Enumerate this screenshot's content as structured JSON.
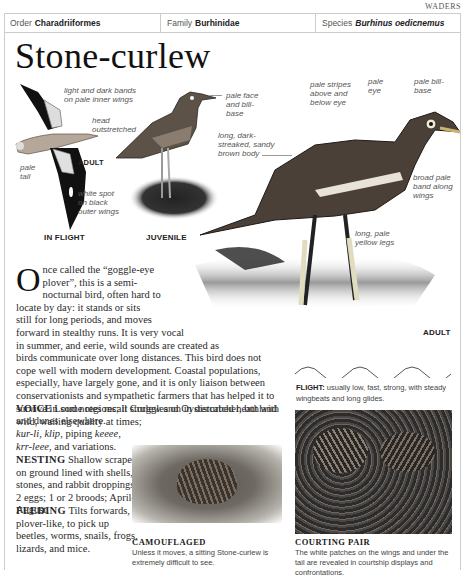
{
  "section_tag": "WADERS",
  "taxonomy": {
    "order_label": "Order",
    "order_value": "Charadriiformes",
    "family_label": "Family",
    "family_value": "Burhinidae",
    "species_label": "Species",
    "species_value": "Burhinus oedicnemus"
  },
  "title": "Stone-curlew",
  "illustrations": {
    "in_flight": {
      "caption": "IN FLIGHT",
      "sub_caption": "ADULT",
      "labels": {
        "bands": "light and dark bands on pale inner wings",
        "head": "head outstretched",
        "tail": "pale tail",
        "spot": "white spot on black outer wings"
      }
    },
    "juvenile": {
      "caption": "JUVENILE",
      "labels": {
        "face": "pale face and bill-base"
      }
    },
    "adult": {
      "caption": "ADULT",
      "labels": {
        "stripes": "pale stripes above and below eye",
        "eye": "pale eye",
        "bill": "pale bill-base",
        "body": "long, dark-streaked, sandy brown body",
        "band": "broad pale band along wings",
        "legs": "long, pale yellow legs"
      }
    }
  },
  "body": {
    "dropcap": "O",
    "intro_line1": "nce called the “goggle-eye",
    "intro_line2": "plover”, this is a semi-",
    "intro_line3": "nocturnal bird, often hard to",
    "intro_line4": "locate by day: it stands or sits",
    "intro_line5": "still for long periods, and moves",
    "intro_line6": "forward in stealthy runs. It is very vocal",
    "intro_line7": "in summer, and eerie, wild sounds are created as",
    "rest": "birds communicate over long distances. This bird does not cope well with modern development. Coastal populations, especially, have largely gone, and it is only liaison between conservationists and sympathetic farmers that has helped it to survive in some regions; it struggles on in disturbed heathland and dunes elsewhere."
  },
  "voice": {
    "heading": "VOICE",
    "text_line1": "Loud notes recall Curlew and Oystercatcher, but with",
    "text_line2": "wild, wailing quality at times;",
    "calls_1": "kur-li",
    "calls_2": "klip",
    "piping": ", piping ",
    "calls_3": "keeee",
    "calls_4": "krr-leee",
    "and_variations": ", and variations."
  },
  "nesting": {
    "heading": "NESTING",
    "text": "Shallow scrape on ground lined with shells, stones, and rabbit droppings; 2 eggs; 1 or 2 broods; April–August."
  },
  "feeding": {
    "heading": "FEEDING",
    "text": "Tilts forwards, plover-like, to pick up beetles, worms, snails, frogs, lizards, and mice."
  },
  "flight": {
    "heading": "FLIGHT:",
    "text": "usually low, fast, strong, with steady wingbeats and long glides."
  },
  "photos": {
    "camouflaged": {
      "title": "CAMOUFLAGED",
      "text": "Unless it moves, a sitting Stone-curlew is extremely difficult to see."
    },
    "courting": {
      "title": "COURTING PAIR",
      "text": "The white patches on the wings and under the tail are revealed in courtship displays and confrontations."
    }
  }
}
